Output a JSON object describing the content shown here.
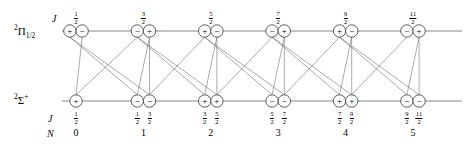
{
  "figure": {
    "type": "energy-level-diagram"
  },
  "states": {
    "upper": {
      "prefix": "2",
      "symbol": "Π",
      "subscript": "1/2",
      "label_text": "²Π₁⁄₂"
    },
    "lower": {
      "prefix": "2",
      "symbol": "Σ",
      "superscript": "+",
      "label_text": "²Σ⁺"
    }
  },
  "row_keys": {
    "j_upper": "J",
    "j_lower": "J",
    "n_lower": "N"
  },
  "upper_levels": [
    {
      "j_num": "1",
      "j_den": "2",
      "parities": [
        "+",
        "−"
      ]
    },
    {
      "j_num": "3",
      "j_den": "2",
      "parities": [
        "−",
        "+"
      ]
    },
    {
      "j_num": "5",
      "j_den": "2",
      "parities": [
        "+",
        "−"
      ]
    },
    {
      "j_num": "7",
      "j_den": "2",
      "parities": [
        "−",
        "+"
      ]
    },
    {
      "j_num": "9",
      "j_den": "2",
      "parities": [
        "+",
        "−"
      ]
    },
    {
      "j_num": "11",
      "j_den": "2",
      "parities": [
        "−",
        "+"
      ]
    }
  ],
  "lower_levels": [
    {
      "n": "0",
      "components": [
        {
          "j_num": "1",
          "j_den": "2",
          "parity": "+"
        }
      ]
    },
    {
      "n": "1",
      "components": [
        {
          "j_num": "1",
          "j_den": "2",
          "parity": "−"
        },
        {
          "j_num": "3",
          "j_den": "2",
          "parity": "−"
        }
      ]
    },
    {
      "n": "2",
      "components": [
        {
          "j_num": "3",
          "j_den": "2",
          "parity": "+"
        },
        {
          "j_num": "5",
          "j_den": "2",
          "parity": "+"
        }
      ]
    },
    {
      "n": "3",
      "components": [
        {
          "j_num": "5",
          "j_den": "2",
          "parity": "−"
        },
        {
          "j_num": "7",
          "j_den": "2",
          "parity": "−"
        }
      ]
    },
    {
      "n": "4",
      "components": [
        {
          "j_num": "7",
          "j_den": "2",
          "parity": "+"
        },
        {
          "j_num": "9",
          "j_den": "2",
          "parity": "+"
        }
      ]
    },
    {
      "n": "5",
      "components": [
        {
          "j_num": "9",
          "j_den": "2",
          "parity": "−"
        },
        {
          "j_num": "11",
          "j_den": "2",
          "parity": "−"
        }
      ]
    }
  ],
  "colors": {
    "line": "#555555",
    "circle_stroke": "#333333",
    "text": "#000000",
    "background": "#ffffff"
  }
}
